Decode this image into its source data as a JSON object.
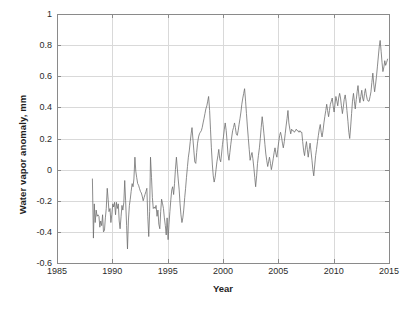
{
  "chart_data": {
    "type": "line",
    "title": "",
    "xlabel": "Year",
    "ylabel": "Water vapor anomaly, mm",
    "xlim": [
      1985,
      2015
    ],
    "ylim": [
      -0.6,
      1.0
    ],
    "xticks": [
      1985,
      1990,
      1995,
      2000,
      2005,
      2010,
      2015
    ],
    "xtick_labels": [
      "1985",
      "1990",
      "1995",
      "2000",
      "2005",
      "2010",
      "2015"
    ],
    "yticks": [
      -0.6,
      -0.4,
      -0.2,
      0,
      0.2,
      0.4,
      0.6,
      0.8,
      1
    ],
    "ytick_labels": [
      "-0.6",
      "-0.4",
      "-0.2",
      "0",
      "0.2",
      "0.4",
      "0.6",
      "0.8",
      "1"
    ],
    "grid": true,
    "legend": null,
    "series": [
      {
        "name": "Water vapor anomaly",
        "color": "#6e6e6e",
        "linewidth": 0.8,
        "x": [
          1988.2,
          1988.29,
          1988.37,
          1988.45,
          1988.54,
          1988.62,
          1988.7,
          1988.79,
          1988.87,
          1988.95,
          1989.04,
          1989.12,
          1989.2,
          1989.29,
          1989.37,
          1989.45,
          1989.54,
          1989.62,
          1989.7,
          1989.79,
          1989.87,
          1989.95,
          1990.04,
          1990.12,
          1990.2,
          1990.29,
          1990.37,
          1990.45,
          1990.54,
          1990.62,
          1990.7,
          1990.79,
          1990.87,
          1990.95,
          1991.04,
          1991.12,
          1991.2,
          1991.29,
          1991.37,
          1991.45,
          1991.54,
          1991.62,
          1991.7,
          1991.79,
          1991.87,
          1991.95,
          1992.04,
          1992.12,
          1992.2,
          1992.29,
          1992.37,
          1992.45,
          1992.54,
          1992.62,
          1992.7,
          1992.79,
          1992.87,
          1992.95,
          1993.04,
          1993.12,
          1993.2,
          1993.29,
          1993.37,
          1993.45,
          1993.54,
          1993.62,
          1993.7,
          1993.79,
          1993.87,
          1993.95,
          1994.04,
          1994.12,
          1994.2,
          1994.29,
          1994.37,
          1994.45,
          1994.54,
          1994.62,
          1994.7,
          1994.79,
          1994.87,
          1994.95,
          1995.04,
          1995.12,
          1995.2,
          1995.29,
          1995.37,
          1995.45,
          1995.54,
          1995.62,
          1995.7,
          1995.79,
          1995.87,
          1995.95,
          1996.04,
          1996.12,
          1996.2,
          1996.29,
          1996.37,
          1996.45,
          1996.54,
          1996.62,
          1996.7,
          1996.79,
          1996.87,
          1996.95,
          1997.04,
          1997.12,
          1997.2,
          1997.29,
          1997.37,
          1997.45,
          1997.54,
          1997.62,
          1997.7,
          1997.79,
          1997.87,
          1997.95,
          1998.04,
          1998.12,
          1998.2,
          1998.29,
          1998.37,
          1998.45,
          1998.54,
          1998.62,
          1998.7,
          1998.79,
          1998.87,
          1998.95,
          1999.04,
          1999.12,
          1999.2,
          1999.29,
          1999.37,
          1999.45,
          1999.54,
          1999.62,
          1999.7,
          1999.79,
          1999.87,
          1999.95,
          2000.04,
          2000.12,
          2000.2,
          2000.29,
          2000.37,
          2000.45,
          2000.54,
          2000.62,
          2000.7,
          2000.79,
          2000.87,
          2000.95,
          2001.04,
          2001.12,
          2001.2,
          2001.29,
          2001.37,
          2001.45,
          2001.54,
          2001.62,
          2001.7,
          2001.79,
          2001.87,
          2001.95,
          2002.04,
          2002.12,
          2002.2,
          2002.29,
          2002.37,
          2002.45,
          2002.54,
          2002.62,
          2002.7,
          2002.79,
          2002.87,
          2002.95,
          2003.04,
          2003.12,
          2003.2,
          2003.29,
          2003.37,
          2003.45,
          2003.54,
          2003.62,
          2003.7,
          2003.79,
          2003.87,
          2003.95,
          2004.04,
          2004.12,
          2004.2,
          2004.29,
          2004.37,
          2004.45,
          2004.54,
          2004.62,
          2004.7,
          2004.79,
          2004.87,
          2004.95,
          2005.04,
          2005.12,
          2005.2,
          2005.29,
          2005.37,
          2005.45,
          2005.54,
          2005.62,
          2005.7,
          2005.79,
          2005.87,
          2005.95,
          2006.04,
          2006.12,
          2006.2,
          2006.29,
          2006.37,
          2006.45,
          2006.54,
          2006.62,
          2006.7,
          2006.79,
          2006.87,
          2006.95,
          2007.04,
          2007.12,
          2007.2,
          2007.29,
          2007.37,
          2007.45,
          2007.54,
          2007.62,
          2007.7,
          2007.79,
          2007.87,
          2007.95,
          2008.04,
          2008.12,
          2008.2,
          2008.29,
          2008.37,
          2008.45,
          2008.54,
          2008.62,
          2008.7,
          2008.79,
          2008.87,
          2008.95,
          2009.04,
          2009.12,
          2009.2,
          2009.29,
          2009.37,
          2009.45,
          2009.54,
          2009.62,
          2009.7,
          2009.79,
          2009.87,
          2009.95,
          2010.04,
          2010.12,
          2010.2,
          2010.29,
          2010.37,
          2010.45,
          2010.54,
          2010.62,
          2010.7,
          2010.79,
          2010.87,
          2010.95,
          2011.04,
          2011.12,
          2011.2,
          2011.29,
          2011.37,
          2011.45,
          2011.54,
          2011.62,
          2011.7,
          2011.79,
          2011.87,
          2011.95,
          2012.04,
          2012.12,
          2012.2,
          2012.29,
          2012.37,
          2012.45,
          2012.54,
          2012.62,
          2012.7,
          2012.79,
          2012.87,
          2012.95,
          2013.04,
          2013.12,
          2013.2,
          2013.29,
          2013.37,
          2013.45,
          2013.54,
          2013.62,
          2013.7,
          2013.79,
          2013.87,
          2013.95,
          2014.04,
          2014.12,
          2014.2,
          2014.29,
          2014.37,
          2014.45,
          2014.54,
          2014.62,
          2014.7,
          2014.79,
          2014.87
        ],
        "y": [
          -0.06,
          -0.44,
          -0.22,
          -0.34,
          -0.26,
          -0.3,
          -0.29,
          -0.3,
          -0.37,
          -0.33,
          -0.36,
          -0.29,
          -0.4,
          -0.39,
          -0.31,
          -0.25,
          -0.12,
          -0.19,
          -0.27,
          -0.25,
          -0.34,
          -0.29,
          -0.22,
          -0.24,
          -0.21,
          -0.29,
          -0.21,
          -0.25,
          -0.22,
          -0.33,
          -0.38,
          -0.3,
          -0.23,
          -0.26,
          -0.21,
          -0.07,
          -0.2,
          -0.36,
          -0.51,
          -0.33,
          -0.23,
          -0.19,
          -0.14,
          -0.09,
          -0.11,
          -0.06,
          0.08,
          -0.01,
          -0.05,
          -0.09,
          -0.1,
          -0.12,
          -0.14,
          -0.15,
          -0.17,
          -0.2,
          -0.18,
          -0.16,
          -0.14,
          -0.12,
          -0.3,
          -0.43,
          -0.27,
          0.08,
          -0.05,
          -0.18,
          -0.25,
          -0.24,
          -0.25,
          -0.23,
          -0.3,
          -0.26,
          -0.35,
          -0.38,
          -0.27,
          -0.19,
          -0.22,
          -0.25,
          -0.31,
          -0.36,
          -0.42,
          -0.31,
          -0.45,
          -0.35,
          -0.27,
          -0.19,
          -0.13,
          -0.11,
          -0.16,
          -0.09,
          0.0,
          0.08,
          0.01,
          -0.06,
          -0.13,
          -0.22,
          -0.29,
          -0.34,
          -0.31,
          -0.26,
          -0.18,
          -0.12,
          -0.05,
          0.02,
          0.08,
          0.12,
          0.18,
          0.23,
          0.27,
          0.19,
          0.12,
          0.05,
          0.04,
          0.11,
          0.17,
          0.21,
          0.23,
          0.24,
          0.25,
          0.27,
          0.3,
          0.33,
          0.36,
          0.39,
          0.41,
          0.44,
          0.47,
          0.38,
          0.26,
          0.14,
          0.03,
          -0.04,
          -0.08,
          -0.05,
          0.0,
          0.05,
          0.09,
          0.13,
          0.07,
          0.05,
          0.1,
          0.16,
          0.21,
          0.26,
          0.3,
          0.25,
          0.18,
          0.1,
          0.06,
          0.11,
          0.16,
          0.21,
          0.25,
          0.27,
          0.3,
          0.27,
          0.23,
          0.22,
          0.25,
          0.29,
          0.33,
          0.37,
          0.42,
          0.46,
          0.49,
          0.52,
          0.44,
          0.36,
          0.28,
          0.2,
          0.13,
          0.06,
          0.09,
          0.11,
          0.07,
          0.01,
          -0.05,
          -0.11,
          -0.04,
          0.04,
          0.09,
          0.14,
          0.2,
          0.27,
          0.34,
          0.29,
          0.23,
          0.16,
          0.1,
          0.06,
          0.02,
          0.05,
          0.08,
          0.04,
          0.0,
          0.03,
          0.07,
          0.11,
          0.14,
          0.1,
          0.08,
          0.13,
          0.18,
          0.22,
          0.24,
          0.21,
          0.17,
          0.14,
          0.18,
          0.23,
          0.28,
          0.33,
          0.38,
          0.3,
          0.26,
          0.23,
          0.26,
          0.25,
          0.25,
          0.24,
          0.25,
          0.26,
          0.25,
          0.25,
          0.24,
          0.25,
          0.24,
          0.24,
          0.18,
          0.12,
          0.09,
          0.14,
          0.18,
          0.13,
          0.08,
          0.13,
          0.17,
          0.12,
          0.06,
          0.0,
          -0.04,
          0.03,
          0.09,
          0.13,
          0.18,
          0.22,
          0.26,
          0.29,
          0.24,
          0.21,
          0.25,
          0.3,
          0.34,
          0.38,
          0.42,
          0.38,
          0.34,
          0.38,
          0.42,
          0.44,
          0.46,
          0.41,
          0.37,
          0.42,
          0.47,
          0.44,
          0.41,
          0.46,
          0.49,
          0.46,
          0.41,
          0.36,
          0.4,
          0.45,
          0.48,
          0.44,
          0.38,
          0.31,
          0.24,
          0.2,
          0.28,
          0.36,
          0.44,
          0.49,
          0.44,
          0.39,
          0.45,
          0.5,
          0.54,
          0.47,
          0.43,
          0.47,
          0.51,
          0.46,
          0.44,
          0.49,
          0.52,
          0.48,
          0.45,
          0.44,
          0.44,
          0.47,
          0.5,
          0.56,
          0.62,
          0.55,
          0.5,
          0.55,
          0.6,
          0.66,
          0.73,
          0.79,
          0.83,
          0.76,
          0.69,
          0.63,
          0.66,
          0.7,
          0.67,
          0.69,
          0.71
        ]
      }
    ]
  },
  "axes": {
    "plot_left": 57,
    "plot_right": 389,
    "plot_top": 14,
    "plot_bottom": 263,
    "frame_color": "#8a8a8a",
    "grid_color": "#d9d9d9",
    "background": "#ffffff"
  }
}
